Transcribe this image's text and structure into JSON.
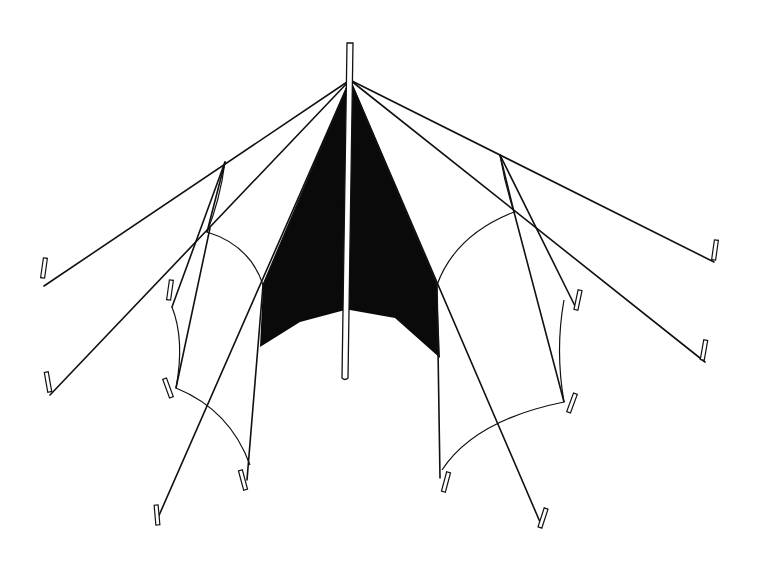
{
  "figure": {
    "width": 760,
    "height": 583,
    "background": "#ffffff",
    "ink_color": "#111111",
    "apex": [
      350,
      80
    ],
    "pole": {
      "top": [
        350,
        43
      ],
      "bottom": [
        345,
        378
      ],
      "width": 6
    },
    "black_panel": {
      "points": "350,80 263,285 260,347 300,322 345,310 350,310 395,318 440,358 437,285"
    },
    "guy_lines": [
      {
        "from": [
          350,
          80
        ],
        "to": [
          44,
          286
        ]
      },
      {
        "from": [
          350,
          80
        ],
        "to": [
          50,
          395
        ]
      },
      {
        "from": [
          350,
          80
        ],
        "to": [
          157,
          520
        ]
      },
      {
        "from": [
          350,
          80
        ],
        "to": [
          714,
          262
        ]
      },
      {
        "from": [
          350,
          80
        ],
        "to": [
          705,
          362
        ]
      },
      {
        "from": [
          350,
          80
        ],
        "to": [
          540,
          522
        ]
      },
      {
        "from": [
          350,
          80
        ],
        "to": [
          263,
          285
        ]
      },
      {
        "from": [
          350,
          80
        ],
        "to": [
          437,
          285
        ]
      }
    ],
    "frame_lines": [
      {
        "from": [
          225,
          162
        ],
        "to": [
          172,
          307
        ]
      },
      {
        "from": [
          225,
          162
        ],
        "to": [
          207,
          232
        ]
      },
      {
        "from": [
          210,
          228
        ],
        "to": [
          176,
          388
        ]
      },
      {
        "from": [
          263,
          285
        ],
        "to": [
          247,
          480
        ]
      },
      {
        "from": [
          500,
          155
        ],
        "to": [
          575,
          306
        ]
      },
      {
        "from": [
          500,
          155
        ],
        "to": [
          514,
          212
        ]
      },
      {
        "from": [
          514,
          212
        ],
        "to": [
          564,
          402
        ]
      },
      {
        "from": [
          437,
          285
        ],
        "to": [
          440,
          478
        ]
      }
    ],
    "curves": [
      {
        "d": "M207,232 Q250,245 263,285"
      },
      {
        "d": "M176,388 Q230,410 250,465"
      },
      {
        "d": "M172,307 Q185,340 176,388"
      },
      {
        "d": "M225,162 Q220,200 207,232"
      },
      {
        "d": "M514,212 Q455,235 437,285"
      },
      {
        "d": "M564,402 Q475,420 442,470"
      },
      {
        "d": "M564,300 Q555,350 564,402"
      },
      {
        "d": "M500,155 Q505,185 514,212"
      }
    ],
    "stakes": [
      {
        "x": 44,
        "y": 268,
        "angle": 8
      },
      {
        "x": 48,
        "y": 382,
        "angle": -10
      },
      {
        "x": 170,
        "y": 290,
        "angle": 8
      },
      {
        "x": 168,
        "y": 388,
        "angle": -20
      },
      {
        "x": 243,
        "y": 480,
        "angle": -15
      },
      {
        "x": 157,
        "y": 515,
        "angle": -5
      },
      {
        "x": 715,
        "y": 250,
        "angle": 8
      },
      {
        "x": 704,
        "y": 350,
        "angle": 10
      },
      {
        "x": 578,
        "y": 300,
        "angle": 12
      },
      {
        "x": 572,
        "y": 403,
        "angle": 20
      },
      {
        "x": 446,
        "y": 482,
        "angle": 15
      },
      {
        "x": 543,
        "y": 518,
        "angle": 18
      }
    ]
  }
}
